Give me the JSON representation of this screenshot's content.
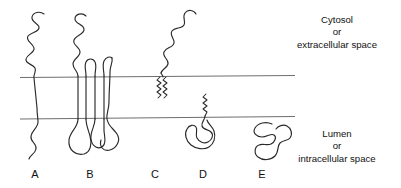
{
  "figure": {
    "type": "membrane-protein-topology-diagram",
    "background_color": "#ffffff",
    "chain_color": "#2a2a2a",
    "membrane_line_color": "#6e6e6e"
  },
  "compartments": {
    "upper": {
      "line1": "Cytosol",
      "line2": "or",
      "line3": "extracellular space"
    },
    "lower": {
      "line1": "Lumen",
      "line2": "or",
      "line3": "intracellular space"
    }
  },
  "membrane": {
    "upper_leaflet_y": 77,
    "lower_leaflet_y": 118,
    "x_start": 20,
    "x_end": 295
  },
  "proteins": [
    {
      "label": "A",
      "label_x": 35,
      "type": "single-pass transmembrane"
    },
    {
      "label": "B",
      "label_x": 90,
      "type": "multi-pass transmembrane"
    },
    {
      "label": "C",
      "label_x": 155,
      "type": "lipid-anchored, upper leaflet"
    },
    {
      "label": "D",
      "label_x": 203,
      "type": "lipid-anchored, lower leaflet"
    },
    {
      "label": "E",
      "label_x": 262,
      "type": "peripheral / soluble"
    }
  ]
}
